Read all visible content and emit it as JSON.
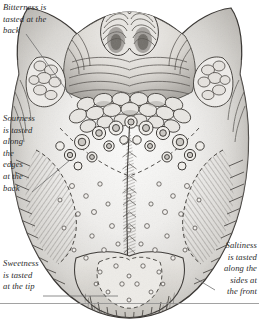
{
  "figure": {
    "view": "dorsal surface of the human tongue",
    "style": "engraving",
    "background_color": "#ffffff",
    "ink_color": "#2b2b2b"
  },
  "labels": {
    "bitterness": {
      "text": "Bitterness is\ntasted at the\nback",
      "lines": [
        "Bitterness is",
        "tasted at the",
        "back"
      ],
      "align": "left"
    },
    "sourness": {
      "text": "Sourness\nis tasted\nalong\nthe\nedges\nat the\nback",
      "lines": [
        "Sourness",
        "is tasted",
        "along",
        "the",
        "edges",
        "at the",
        "back"
      ],
      "align": "left"
    },
    "sweetness": {
      "text": "Sweetness\nis tasted\nat the tip",
      "lines": [
        "Sweetness",
        "is tasted",
        "at the tip"
      ],
      "align": "left"
    },
    "saltiness": {
      "text": "Saltiness\nis tasted\nalong the\nsides at\nthe front",
      "lines": [
        "Saltiness",
        "is tasted",
        "along the",
        "sides at",
        "the front"
      ],
      "align": "right"
    }
  },
  "anatomy": {
    "parts": [
      "epiglottis",
      "lingual tonsil",
      "palatine tonsil",
      "circumvallate papillae",
      "foliate papillae",
      "fungiform papillae",
      "median sulcus",
      "tongue tip"
    ]
  },
  "rules": {
    "baseline_rule": "horizontal rule across full width near the bottom"
  }
}
